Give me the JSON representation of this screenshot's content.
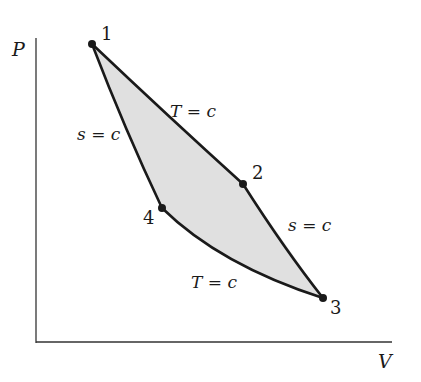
{
  "diagram": {
    "type": "P-V diagram (Carnot cycle)",
    "axes": {
      "y_label": "P",
      "x_label": "V"
    },
    "states": [
      {
        "id": "1",
        "label": "1",
        "x": 92,
        "y": 44
      },
      {
        "id": "2",
        "label": "2",
        "x": 243,
        "y": 184
      },
      {
        "id": "3",
        "label": "3",
        "x": 323,
        "y": 298
      },
      {
        "id": "4",
        "label": "4",
        "x": 162,
        "y": 208
      }
    ],
    "processes": [
      {
        "from": "1",
        "to": "2",
        "label": "T = c"
      },
      {
        "from": "2",
        "to": "3",
        "label": "s = c"
      },
      {
        "from": "3",
        "to": "4",
        "label": "T = c"
      },
      {
        "from": "4",
        "to": "1",
        "label": "s = c"
      }
    ],
    "colors": {
      "fill": "#e0e0e0",
      "line": "#1a1a1a"
    }
  }
}
